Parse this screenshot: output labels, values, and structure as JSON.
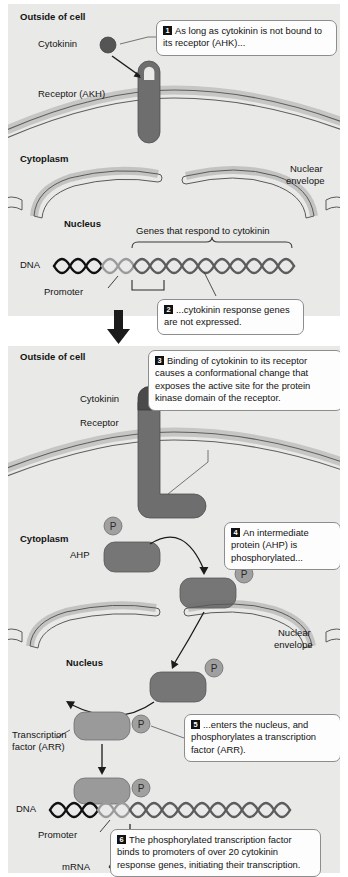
{
  "figure": {
    "type": "biological-signaling-diagram",
    "colors": {
      "panel_background": "#e9e9e7",
      "page_background": "#ffffff",
      "receptor_dark": "#6e6e6e",
      "cytokinin_dark": "#555555",
      "ahp_protein": "#767676",
      "arr_protein": "#9a9a9a",
      "phosphate_badge": "#a0a0a0",
      "dna_dark": "#111111",
      "dna_gray": "#707070",
      "promoter_gray": "#9b9b9b",
      "membrane_line": "#6a6a6a",
      "callout_border": "#8d8d8d",
      "callout_fill": "#fdfdfd",
      "badge_fill": "#111111",
      "badge_text": "#ffffff"
    }
  },
  "panel1": {
    "name": "Inactive state — cytokinin not bound",
    "labels": {
      "outside": "Outside of cell",
      "cytokinin": "Cytokinin",
      "receptor": "Receptor (AKH)",
      "cytoplasm": "Cytoplasm",
      "nucleus": "Nucleus",
      "nuclear_envelope_line1": "Nuclear",
      "nuclear_envelope_line2": "envelope",
      "genes_bracket": "Genes that respond to cytokinin",
      "dna": "DNA",
      "promoter": "Promoter"
    },
    "callouts": [
      {
        "num": "1",
        "text": "As long as cytokinin is not bound to its receptor (AHK)..."
      },
      {
        "num": "2",
        "text": "...cytokinin response genes are not expressed."
      }
    ]
  },
  "panel2": {
    "name": "Active state — cytokinin bound, signal transduced",
    "labels": {
      "outside": "Outside of cell",
      "cytokinin": "Cytokinin",
      "receptor": "Receptor",
      "cytoplasm": "Cytoplasm",
      "ahp": "AHP",
      "nuclear_envelope_line1": "Nuclear",
      "nuclear_envelope_line2": "envelope",
      "nucleus": "Nucleus",
      "transcription_factor_line1": "Transcription",
      "transcription_factor_line2": "factor (ARR)",
      "dna": "DNA",
      "promoter": "Promoter",
      "transcription": "Transcription",
      "mrna": "mRNA",
      "phosphate": "P"
    },
    "callouts": [
      {
        "num": "3",
        "text": "Binding of cytokinin to its receptor causes a conformational change that exposes the active site for the protein kinase domain of the receptor."
      },
      {
        "num": "4",
        "text": "An intermediate protein (AHP) is phosphorylated..."
      },
      {
        "num": "5",
        "text": "...enters the nucleus, and phosphorylates a transcription factor (ARR)."
      },
      {
        "num": "6",
        "text": "The phosphorylated transcription factor binds to promoters of over 20 cytokinin response genes, initiating their transcription."
      }
    ]
  }
}
